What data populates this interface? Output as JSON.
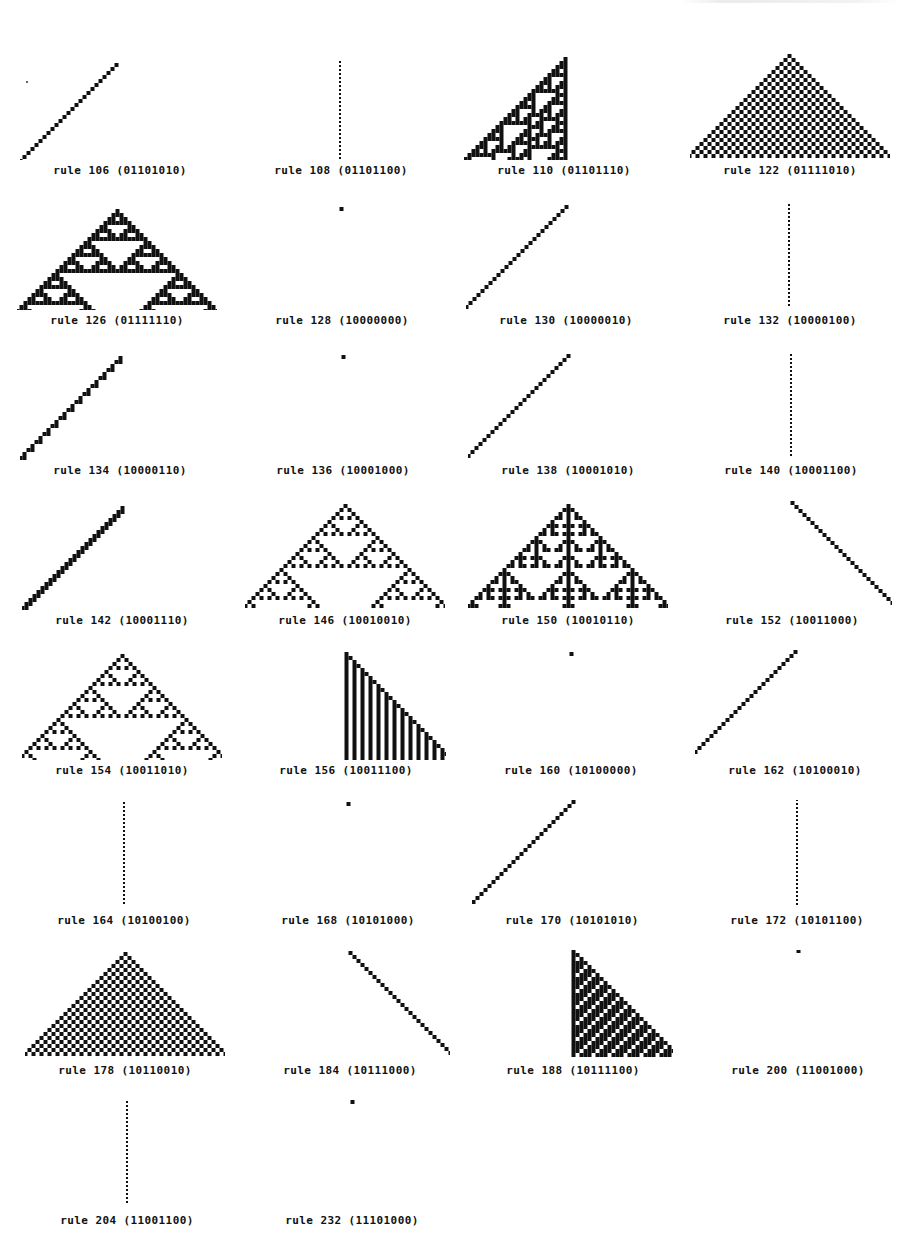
{
  "figure": {
    "caption_format": "rule N (binary)",
    "ink_color": "#111111",
    "background_color": "#ffffff",
    "columns": 4
  },
  "chart_data": {
    "type": "table",
    "items": [
      {
        "rule": 106,
        "binary": "01101010",
        "label": "rule 106 (01101010)",
        "shape": "left-half",
        "pattern": "sierpinski-like left triangle"
      },
      {
        "rule": 108,
        "binary": "01101100",
        "label": "rule 108 (01101100)",
        "shape": "dotted-line",
        "pattern": "vertical dotted line"
      },
      {
        "rule": 110,
        "binary": "01101110",
        "label": "rule 110 (01101110)",
        "shape": "left-half",
        "pattern": "complex left triangle"
      },
      {
        "rule": 122,
        "binary": "01111010",
        "label": "rule 122 (01111010)",
        "shape": "full",
        "pattern": "solid triangle"
      },
      {
        "rule": 126,
        "binary": "01111110",
        "label": "rule 126 (01111110)",
        "shape": "full",
        "pattern": "nested stripes triangle"
      },
      {
        "rule": 128,
        "binary": "10000000",
        "label": "rule 128 (10000000)",
        "shape": "solid-line",
        "pattern": "vertical solid line"
      },
      {
        "rule": 130,
        "binary": "10000010",
        "label": "rule 130 (10000010)",
        "shape": "left-half",
        "pattern": "checkered left triangle"
      },
      {
        "rule": 132,
        "binary": "10000100",
        "label": "rule 132 (10000100)",
        "shape": "dotted-line",
        "pattern": "vertical dotted line"
      },
      {
        "rule": 134,
        "binary": "10000110",
        "label": "rule 134 (10000110)",
        "shape": "left-half",
        "pattern": "complex left triangle"
      },
      {
        "rule": 136,
        "binary": "10001000",
        "label": "rule 136 (10001000)",
        "shape": "solid-line",
        "pattern": "vertical solid line"
      },
      {
        "rule": 138,
        "binary": "10001010",
        "label": "rule 138 (10001010)",
        "shape": "left-half",
        "pattern": "complex left triangle"
      },
      {
        "rule": 140,
        "binary": "10001100",
        "label": "rule 140 (10001100)",
        "shape": "dotted-line",
        "pattern": "vertical dotted line"
      },
      {
        "rule": 142,
        "binary": "10001110",
        "label": "rule 142 (10001110)",
        "shape": "left-half",
        "pattern": "complex left triangle"
      },
      {
        "rule": 146,
        "binary": "10010010",
        "label": "rule 146 (10010010)",
        "shape": "full",
        "pattern": "checkered triangle with border"
      },
      {
        "rule": 150,
        "binary": "10010110",
        "label": "rule 150 (10010110)",
        "shape": "full",
        "pattern": "additive nested triangle"
      },
      {
        "rule": 152,
        "binary": "10011000",
        "label": "rule 152 (10011000)",
        "shape": "right-half",
        "pattern": "checkered right triangle"
      },
      {
        "rule": 154,
        "binary": "10011010",
        "label": "rule 154 (10011010)",
        "shape": "full",
        "pattern": "diagonal stripes triangle"
      },
      {
        "rule": 156,
        "binary": "10011100",
        "label": "rule 156 (10011100)",
        "shape": "right-half",
        "pattern": "complex right triangle"
      },
      {
        "rule": 160,
        "binary": "10100000",
        "label": "rule 160 (10100000)",
        "shape": "solid-line",
        "pattern": "vertical solid line"
      },
      {
        "rule": 162,
        "binary": "10100010",
        "label": "rule 162 (10100010)",
        "shape": "left-half",
        "pattern": "sparse left triangle"
      },
      {
        "rule": 164,
        "binary": "10100100",
        "label": "rule 164 (10100100)",
        "shape": "dotted-line",
        "pattern": "vertical dotted line"
      },
      {
        "rule": 168,
        "binary": "10101000",
        "label": "rule 168 (10101000)",
        "shape": "solid-line",
        "pattern": "vertical solid line"
      },
      {
        "rule": 170,
        "binary": "10101010",
        "label": "rule 170 (10101010)",
        "shape": "left-half",
        "pattern": "sierpinski left triangle"
      },
      {
        "rule": 172,
        "binary": "10101100",
        "label": "rule 172 (10101100)",
        "shape": "dotted-line",
        "pattern": "vertical dotted line"
      },
      {
        "rule": 178,
        "binary": "10110010",
        "label": "rule 178 (10110010)",
        "shape": "outline",
        "pattern": "double-line chevron"
      },
      {
        "rule": 184,
        "binary": "10111000",
        "label": "rule 184 (10111000)",
        "shape": "right-half",
        "pattern": "complex right triangle"
      },
      {
        "rule": 188,
        "binary": "10111100",
        "label": "rule 188 (10111100)",
        "shape": "right-half",
        "pattern": "complex right triangle"
      },
      {
        "rule": 200,
        "binary": "11001000",
        "label": "rule 200 (11001000)",
        "shape": "solid-line",
        "pattern": "vertical solid line"
      },
      {
        "rule": 204,
        "binary": "11001100",
        "label": "rule 204 (11001100)",
        "shape": "dotted-line",
        "pattern": "vertical dotted line"
      },
      {
        "rule": 232,
        "binary": "11101000",
        "label": "rule 232 (11101000)",
        "shape": "solid-line",
        "pattern": "vertical solid line"
      }
    ]
  },
  "panels": [
    {
      "label": "rule 106 (01101010)",
      "rule": 106,
      "shape": "left-half",
      "x": 20,
      "y": 50,
      "apex_x": 96,
      "apex_y": 9,
      "rows": 26,
      "cell": 3
    },
    {
      "label": "rule 108 (01101100)",
      "rule": 108,
      "shape": "dotted-line",
      "x": 241,
      "y": 50,
      "apex_x": 99,
      "apex_y": 7,
      "rows": 26,
      "cell": 3
    },
    {
      "label": "rule 110 (01101110)",
      "rule": 110,
      "shape": "left-half",
      "x": 464,
      "y": 50,
      "apex_x": 101,
      "apex_y": 3,
      "rows": 27,
      "cell": 3
    },
    {
      "label": "rule 122 (01111010)",
      "rule": 122,
      "shape": "full",
      "x": 690,
      "y": 50,
      "apex_x": 99,
      "apex_y": 0,
      "rows": 26,
      "cell": 3
    },
    {
      "label": "rule 126 (01111110)",
      "rule": 126,
      "shape": "full",
      "x": 17,
      "y": 200,
      "apex_x": 100,
      "apex_y": 5,
      "rows": 26,
      "cell": 3
    },
    {
      "label": "rule 128 (10000000)",
      "rule": 128,
      "shape": "solid-line",
      "x": 242,
      "y": 200,
      "apex_x": 99,
      "apex_y": 3,
      "rows": 26,
      "cell": 3
    },
    {
      "label": "rule 130 (10000010)",
      "rule": 130,
      "shape": "left-half",
      "x": 466,
      "y": 200,
      "apex_x": 100,
      "apex_y": 1,
      "rows": 27,
      "cell": 3
    },
    {
      "label": "rule 132 (10000100)",
      "rule": 132,
      "shape": "dotted-line",
      "x": 690,
      "y": 200,
      "apex_x": 99,
      "apex_y": 0,
      "rows": 26,
      "cell": 3
    },
    {
      "label": "rule 134 (10000110)",
      "rule": 134,
      "shape": "left-half",
      "x": 20,
      "y": 350,
      "apex_x": 100,
      "apex_y": 2,
      "rows": 26,
      "cell": 3
    },
    {
      "label": "rule 136 (10001000)",
      "rule": 136,
      "shape": "solid-line",
      "x": 243,
      "y": 350,
      "apex_x": 100,
      "apex_y": 1,
      "rows": 26,
      "cell": 3
    },
    {
      "label": "rule 138 (10001010)",
      "rule": 138,
      "shape": "left-half",
      "x": 468,
      "y": 350,
      "apex_x": 100,
      "apex_y": 0,
      "rows": 27,
      "cell": 3
    },
    {
      "label": "rule 140 (10001100)",
      "rule": 140,
      "shape": "dotted-line",
      "x": 691,
      "y": 350,
      "apex_x": 100,
      "apex_y": 0,
      "rows": 26,
      "cell": 3
    },
    {
      "label": "rule 142 (10001110)",
      "rule": 142,
      "shape": "left-half",
      "x": 22,
      "y": 500,
      "apex_x": 100,
      "apex_y": 2,
      "rows": 26,
      "cell": 3
    },
    {
      "label": "rule 146 (10010010)",
      "rule": 146,
      "shape": "full",
      "x": 245,
      "y": 500,
      "apex_x": 100,
      "apex_y": 0,
      "rows": 26,
      "cell": 3
    },
    {
      "label": "rule 150 (10010110)",
      "rule": 150,
      "shape": "full",
      "x": 468,
      "y": 500,
      "apex_x": 100,
      "apex_y": 0,
      "rows": 26,
      "cell": 3
    },
    {
      "label": "rule 152 (10011000)",
      "rule": 152,
      "shape": "right-half",
      "x": 692,
      "y": 500,
      "apex_x": 100,
      "apex_y": -3,
      "rows": 27,
      "cell": 3
    },
    {
      "label": "rule 154 (10011010)",
      "rule": 154,
      "shape": "full",
      "x": 22,
      "y": 650,
      "apex_x": 100,
      "apex_y": 0,
      "rows": 27,
      "cell": 3
    },
    {
      "label": "rule 156 (10011100)",
      "rule": 156,
      "shape": "right-half",
      "x": 246,
      "y": 650,
      "apex_x": 100,
      "apex_y": -2,
      "rows": 27,
      "cell": 3
    },
    {
      "label": "rule 160 (10100000)",
      "rule": 160,
      "shape": "solid-line",
      "x": 471,
      "y": 650,
      "apex_x": 100,
      "apex_y": -2,
      "rows": 26,
      "cell": 3
    },
    {
      "label": "rule 162 (10100010)",
      "rule": 162,
      "shape": "left-half",
      "x": 695,
      "y": 650,
      "apex_x": 100,
      "apex_y": -4,
      "rows": 27,
      "cell": 3
    },
    {
      "label": "rule 164 (10100100)",
      "rule": 164,
      "shape": "dotted-line",
      "x": 24,
      "y": 800,
      "apex_x": 100,
      "apex_y": -2,
      "rows": 26,
      "cell": 3
    },
    {
      "label": "rule 168 (10101000)",
      "rule": 168,
      "shape": "solid-line",
      "x": 248,
      "y": 800,
      "apex_x": 100,
      "apex_y": -2,
      "rows": 26,
      "cell": 3
    },
    {
      "label": "rule 170 (10101010)",
      "rule": 170,
      "shape": "left-half",
      "x": 472,
      "y": 800,
      "apex_x": 101,
      "apex_y": -4,
      "rows": 27,
      "cell": 3
    },
    {
      "label": "rule 172 (10101100)",
      "rule": 172,
      "shape": "dotted-line",
      "x": 697,
      "y": 800,
      "apex_x": 100,
      "apex_y": -5,
      "rows": 27,
      "cell": 3
    },
    {
      "label": "rule 178 (10110010)",
      "rule": 178,
      "shape": "full",
      "x": 25,
      "y": 950,
      "apex_x": 100,
      "apex_y": -2,
      "rows": 26,
      "cell": 3
    },
    {
      "label": "rule 184 (10111000)",
      "rule": 184,
      "shape": "right-half",
      "x": 250,
      "y": 950,
      "apex_x": 100,
      "apex_y": -3,
      "rows": 26,
      "cell": 3
    },
    {
      "label": "rule 188 (10111100)",
      "rule": 188,
      "shape": "right-half",
      "x": 473,
      "y": 950,
      "apex_x": 100,
      "apex_y": -5,
      "rows": 27,
      "cell": 3
    },
    {
      "label": "rule 200 (11001000)",
      "rule": 200,
      "shape": "solid-line",
      "x": 698,
      "y": 950,
      "apex_x": 100,
      "apex_y": -5,
      "rows": 27,
      "cell": 3
    },
    {
      "label": "rule 204 (11001100)",
      "rule": 204,
      "shape": "dotted-line",
      "x": 27,
      "y": 1100,
      "apex_x": 100,
      "apex_y": -3,
      "rows": 26,
      "cell": 3
    },
    {
      "label": "rule 232 (11101000)",
      "rule": 232,
      "shape": "solid-line",
      "x": 252,
      "y": 1100,
      "apex_x": 100,
      "apex_y": -4,
      "rows": 26,
      "cell": 3
    }
  ]
}
